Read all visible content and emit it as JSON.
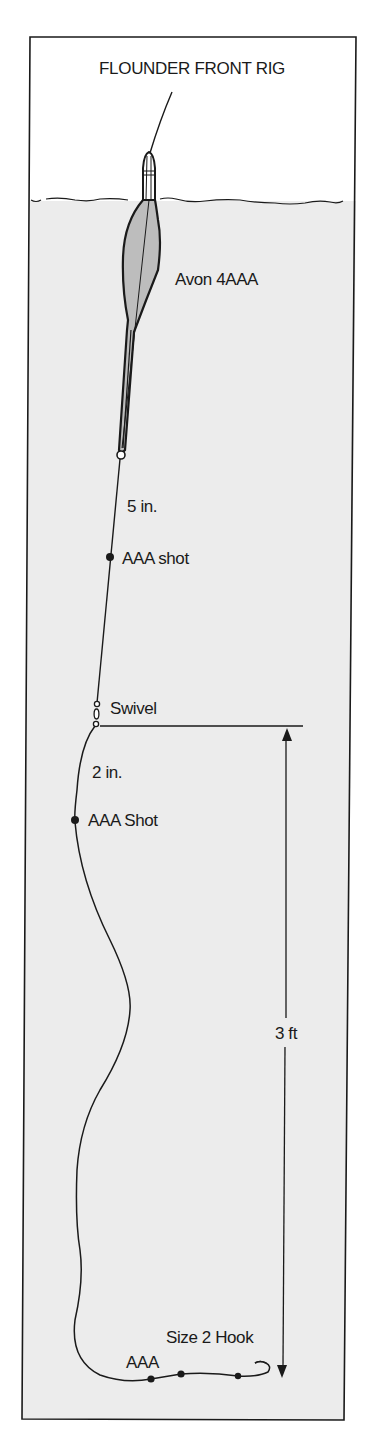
{
  "diagram": {
    "title": "FLOUNDER FRONT RIG",
    "colors": {
      "ink": "#1a1a1a",
      "water": "#ececec",
      "float_fill": "#bdbdbd",
      "paper": "#ffffff"
    },
    "components": [
      {
        "id": "float",
        "label": "Avon 4AAA"
      },
      {
        "id": "distance-float-to-shot",
        "label": "5 in."
      },
      {
        "id": "upper-shot",
        "label": "AAA shot"
      },
      {
        "id": "swivel",
        "label": "Swivel"
      },
      {
        "id": "distance-swivel-to-shot",
        "label": "2 in."
      },
      {
        "id": "lower-shot",
        "label": "AAA Shot"
      },
      {
        "id": "depth-measure",
        "label": "3 ft"
      },
      {
        "id": "hook",
        "label": "Size 2 Hook"
      },
      {
        "id": "bottom-shots",
        "label": "AAA"
      }
    ],
    "labels": {
      "float": "Avon 4AAA",
      "dist_5in": "5 in.",
      "upper_shot": "AAA shot",
      "swivel": "Swivel",
      "dist_2in": "2 in.",
      "lower_shot": "AAA Shot",
      "depth": "3 ft",
      "hook": "Size 2 Hook",
      "bottom_shots": "AAA"
    }
  }
}
